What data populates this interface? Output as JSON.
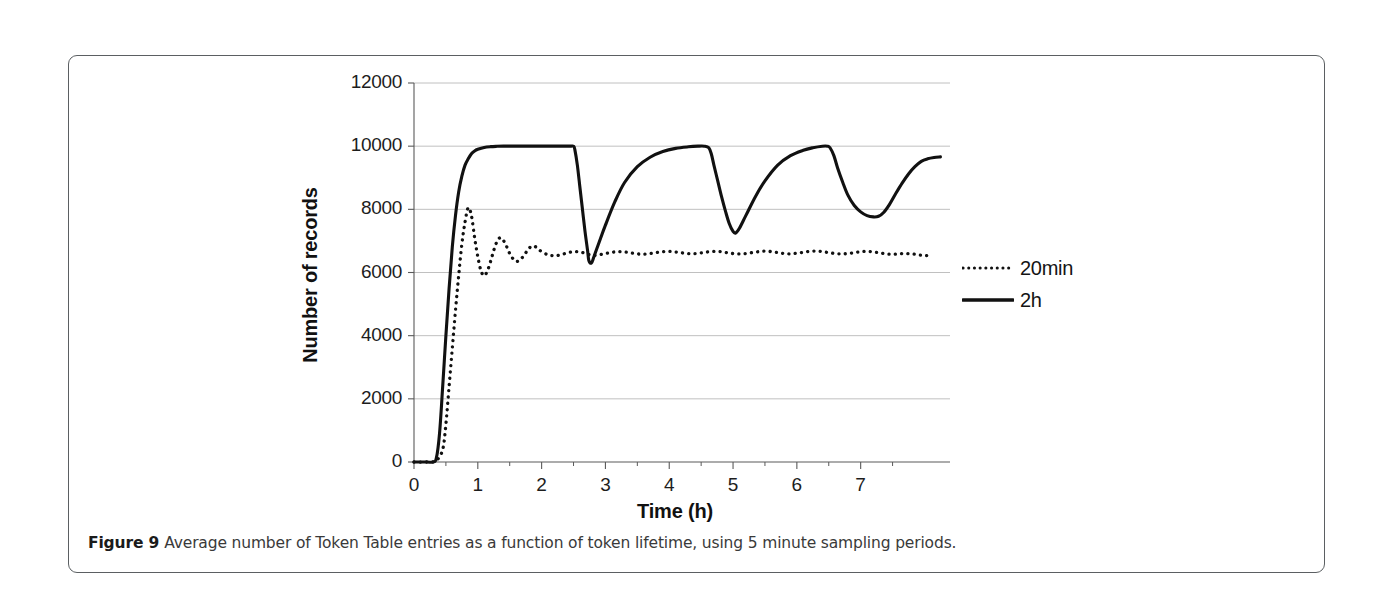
{
  "figure": {
    "caption_lead": "Figure 9",
    "caption_text": "Average number of Token Table entries as a function of token lifetime, using 5 minute sampling periods.",
    "frame_color": "#5b5f62",
    "background": "#ffffff"
  },
  "chart_data": {
    "type": "line",
    "title": "",
    "xlabel": "Time (h)",
    "ylabel": "Number of records",
    "xlim": [
      0,
      8.4
    ],
    "ylim": [
      0,
      12000
    ],
    "grid": true,
    "grid_color": "#b9b9b9",
    "axis_color": "#5a5a5a",
    "line_color": "#111111",
    "legend_position": "right",
    "x_ticks": [
      0,
      1,
      2,
      3,
      4,
      5,
      6,
      7
    ],
    "x_tick_labels": [
      "0",
      "1",
      "2",
      "3",
      "4",
      "5",
      "6",
      "7"
    ],
    "x_minor_ticks": [
      0.5,
      1.5,
      2.5,
      3.5,
      4.5,
      5.5,
      6.5,
      7.5
    ],
    "y_ticks": [
      0,
      2000,
      4000,
      6000,
      8000,
      10000,
      12000
    ],
    "y_tick_labels": [
      "0",
      "2000",
      "4000",
      "6000",
      "8000",
      "10000",
      "12000"
    ],
    "series": [
      {
        "name": "20min",
        "style": "dotted",
        "x": [
          0.0,
          0.2,
          0.35,
          0.45,
          0.5,
          0.55,
          0.6,
          0.65,
          0.7,
          0.75,
          0.8,
          0.85,
          0.9,
          0.95,
          1.0,
          1.05,
          1.1,
          1.15,
          1.2,
          1.25,
          1.3,
          1.35,
          1.4,
          1.45,
          1.5,
          1.55,
          1.6,
          1.65,
          1.7,
          1.75,
          1.8,
          1.85,
          1.9,
          1.95,
          2.0,
          2.1,
          2.2,
          2.3,
          2.4,
          2.5,
          2.6,
          2.7,
          2.75,
          2.8,
          2.9,
          3.0,
          3.1,
          3.2,
          3.3,
          3.4,
          3.5,
          3.6,
          3.7,
          3.8,
          3.9,
          4.0,
          4.1,
          4.2,
          4.3,
          4.4,
          4.5,
          4.6,
          4.7,
          4.8,
          4.9,
          5.0,
          5.1,
          5.2,
          5.3,
          5.4,
          5.5,
          5.6,
          5.7,
          5.8,
          5.9,
          6.0,
          6.1,
          6.2,
          6.3,
          6.4,
          6.5,
          6.6,
          6.7,
          6.8,
          6.9,
          7.0,
          7.1,
          7.2,
          7.3,
          7.4,
          7.5,
          7.6,
          7.7,
          7.8,
          7.9,
          8.0,
          8.1
        ],
        "y": [
          0,
          0,
          50,
          400,
          1200,
          2400,
          3600,
          4800,
          5900,
          6900,
          7600,
          8050,
          7800,
          7100,
          6500,
          6050,
          5900,
          6050,
          6350,
          6700,
          6980,
          7100,
          7020,
          6830,
          6600,
          6440,
          6350,
          6380,
          6480,
          6620,
          6760,
          6840,
          6820,
          6740,
          6660,
          6560,
          6530,
          6560,
          6620,
          6660,
          6650,
          6600,
          6560,
          6540,
          6560,
          6600,
          6640,
          6660,
          6650,
          6620,
          6590,
          6580,
          6600,
          6630,
          6660,
          6670,
          6650,
          6620,
          6600,
          6600,
          6620,
          6650,
          6670,
          6660,
          6630,
          6600,
          6590,
          6600,
          6630,
          6660,
          6680,
          6660,
          6630,
          6600,
          6590,
          6610,
          6640,
          6670,
          6680,
          6660,
          6630,
          6600,
          6590,
          6600,
          6630,
          6660,
          6670,
          6650,
          6620,
          6590,
          6580,
          6590,
          6600,
          6590,
          6560,
          6540,
          6520
        ]
      },
      {
        "name": "2h",
        "style": "solid",
        "x": [
          0.0,
          0.2,
          0.3,
          0.35,
          0.4,
          0.45,
          0.5,
          0.55,
          0.6,
          0.65,
          0.7,
          0.75,
          0.8,
          0.85,
          0.9,
          0.95,
          1.0,
          1.1,
          1.2,
          1.3,
          1.4,
          1.5,
          1.7,
          1.9,
          2.1,
          2.3,
          2.45,
          2.5,
          2.52,
          2.56,
          2.6,
          2.64,
          2.68,
          2.72,
          2.74,
          2.78,
          2.82,
          2.9,
          3.0,
          3.15,
          3.3,
          3.5,
          3.7,
          3.9,
          4.1,
          4.3,
          4.45,
          4.55,
          4.62,
          4.66,
          4.7,
          4.76,
          4.82,
          4.88,
          4.94,
          5.0,
          5.04,
          5.1,
          5.2,
          5.35,
          5.5,
          5.7,
          5.9,
          6.1,
          6.25,
          6.4,
          6.48,
          6.52,
          6.58,
          6.64,
          6.72,
          6.8,
          6.9,
          7.0,
          7.1,
          7.2,
          7.28,
          7.36,
          7.45,
          7.55,
          7.65,
          7.75,
          7.85,
          7.95,
          8.05,
          8.15,
          8.25
        ],
        "y": [
          0,
          0,
          0,
          120,
          900,
          2400,
          4000,
          5500,
          6800,
          7800,
          8550,
          9050,
          9400,
          9600,
          9760,
          9850,
          9900,
          9960,
          9985,
          9995,
          10000,
          10000,
          10000,
          10000,
          10000,
          10000,
          10000,
          10000,
          9900,
          9400,
          8700,
          8000,
          7300,
          6700,
          6380,
          6300,
          6500,
          6950,
          7500,
          8250,
          8850,
          9350,
          9650,
          9830,
          9930,
          9980,
          10000,
          10000,
          9950,
          9750,
          9400,
          8900,
          8400,
          7950,
          7550,
          7300,
          7250,
          7400,
          7800,
          8400,
          8900,
          9400,
          9700,
          9870,
          9950,
          10000,
          10000,
          9950,
          9700,
          9300,
          8850,
          8450,
          8120,
          7920,
          7800,
          7760,
          7780,
          7900,
          8150,
          8500,
          8830,
          9120,
          9350,
          9520,
          9600,
          9640,
          9660
        ]
      }
    ]
  },
  "legend": {
    "items": [
      {
        "label": "20min",
        "style": "dotted"
      },
      {
        "label": "2h",
        "style": "solid"
      }
    ]
  }
}
